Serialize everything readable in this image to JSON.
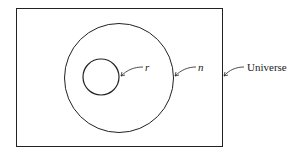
{
  "diagram": {
    "type": "venn",
    "sets": [
      {
        "id": "universe",
        "label": "Universe"
      },
      {
        "id": "n",
        "label": "n"
      },
      {
        "id": "r",
        "label": "r"
      }
    ],
    "labels": {
      "universe": "Universe",
      "n": "n",
      "r": "r"
    },
    "colors": {
      "stroke": "#222222",
      "background": "#ffffff"
    }
  }
}
